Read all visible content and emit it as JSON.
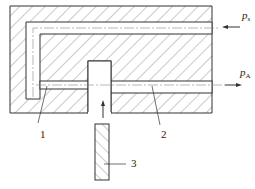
{
  "diagram": {
    "type": "pneumatic nozzle-flapper / fluid channel cross-section",
    "labels": {
      "supply_pressure": {
        "symbol": "p",
        "subscript": "s"
      },
      "output_pressure": {
        "symbol": "p",
        "subscript": "A"
      }
    },
    "parts": [
      {
        "id": "1",
        "label": "1"
      },
      {
        "id": "2",
        "label": "2"
      },
      {
        "id": "3",
        "label": "3"
      }
    ],
    "colors": {
      "line": "#333333",
      "hatch": "#555555",
      "background": "#ffffff"
    }
  }
}
